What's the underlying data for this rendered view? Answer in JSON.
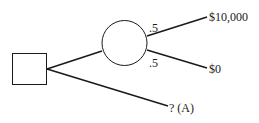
{
  "diagram": {
    "type": "decision-tree",
    "decision_node": {
      "shape": "square"
    },
    "chance_node": {
      "shape": "circle"
    },
    "branches": [
      {
        "from": "decision",
        "to": "chance",
        "label": ""
      },
      {
        "from": "decision",
        "to": "outcome",
        "outcome": "? (A)"
      }
    ],
    "chance_branches": [
      {
        "probability": ".5",
        "outcome": "$10,000"
      },
      {
        "probability": ".5",
        "outcome": "$0"
      }
    ],
    "colors": {
      "stroke": "#1a1a1a",
      "background": "#ffffff"
    }
  }
}
